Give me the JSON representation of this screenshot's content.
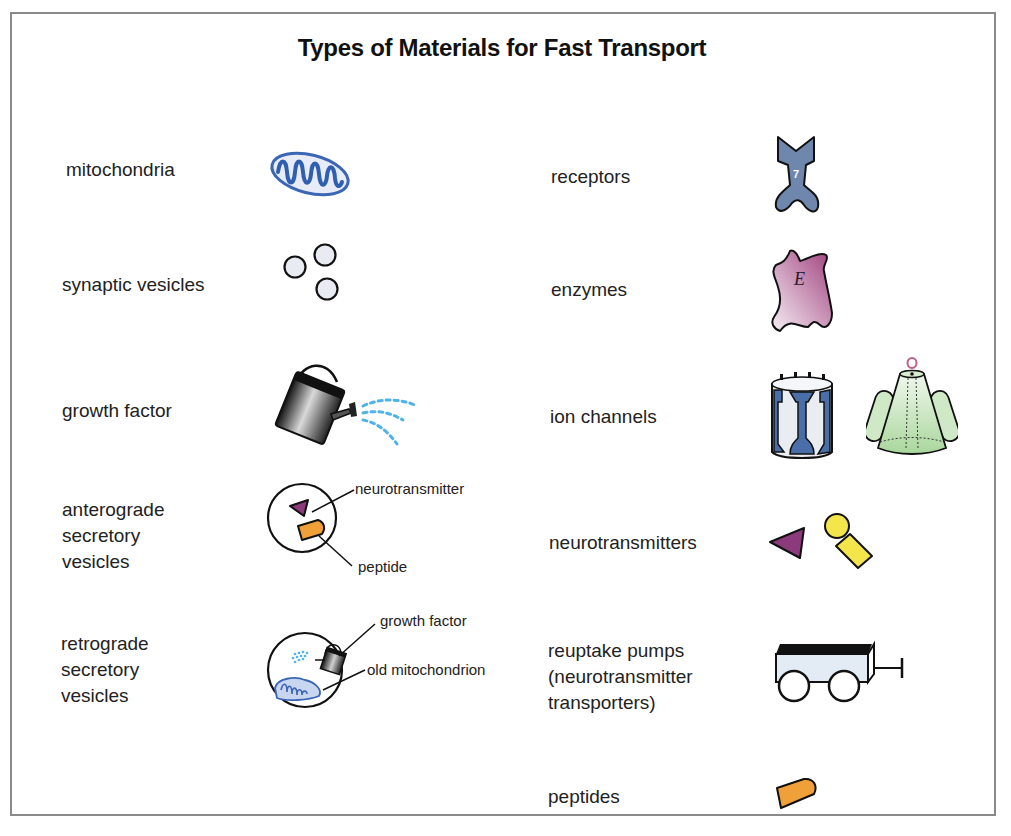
{
  "diagram": {
    "title": "Types of Materials for Fast Transport",
    "left_column": [
      {
        "label": "mitochondria",
        "icon": "mitochondrion-icon"
      },
      {
        "label": "synaptic vesicles",
        "icon": "synaptic-vesicles-icon"
      },
      {
        "label": "growth factor",
        "icon": "watering-can-icon"
      },
      {
        "label": "anterograde\nsecretory\nvesicles",
        "icon": "anterograde-vesicle-icon",
        "callouts": [
          "neurotransmitter",
          "peptide"
        ]
      },
      {
        "label": "retrograde\nsecretory\nvesicles",
        "icon": "retrograde-vesicle-icon",
        "callouts": [
          "growth factor",
          "old mitochondrion"
        ]
      }
    ],
    "right_column": [
      {
        "label": "receptors",
        "icon": "receptor-icon",
        "icon_text": "7"
      },
      {
        "label": "enzymes",
        "icon": "enzyme-icon",
        "icon_text": "E"
      },
      {
        "label": "ion channels",
        "icon": "ion-channel-icon"
      },
      {
        "label": "neurotransmitters",
        "icon": "neurotransmitter-icon"
      },
      {
        "label": "reuptake pumps\n(neurotransmitter\ntransporters)",
        "icon": "wagon-icon"
      },
      {
        "label": "peptides",
        "icon": "peptide-icon"
      }
    ],
    "colors": {
      "mito_blue": "#3a66b5",
      "vesicle_fill": "#e6e9f0",
      "spray_blue": "#4fb3e8",
      "neurotransmitter_purple": "#8b3a7c",
      "peptide_orange": "#f0a038",
      "receptor_slate": "#6f86ad",
      "enzyme_pink": "#b05a94",
      "channel_blue": "#4a6fa8",
      "channel_green": "#a9d79c",
      "transmitter_yellow": "#f4e64a"
    }
  }
}
